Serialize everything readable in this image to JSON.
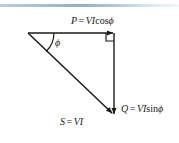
{
  "figure": {
    "type": "power-triangle-diagram",
    "background_color": "#ffffff",
    "stroke_color": "#1a1a1a",
    "top_rule_color": "#8fb0c7"
  },
  "labels": {
    "real_power": {
      "symbol": "P",
      "equals": "=",
      "magnitude": "VI",
      "trig": "cos",
      "angle": "ϕ",
      "full_text": "P = VI cos ϕ"
    },
    "reactive_power": {
      "symbol": "Q",
      "equals": "=",
      "magnitude": "VI",
      "trig": "sin",
      "angle": "ϕ",
      "full_text": "Q = VI sin ϕ"
    },
    "apparent_power": {
      "symbol": "S",
      "equals": "=",
      "magnitude": "VI",
      "full_text": "S = VI"
    },
    "phase_angle": {
      "symbol": "ϕ",
      "full_text": "ϕ"
    }
  },
  "geometry": {
    "apex": {
      "x": 28,
      "y": 33
    },
    "corner_right_angle": {
      "x": 114,
      "y": 33
    },
    "vertex_bottom": {
      "x": 114,
      "y": 115
    },
    "angle_arc_radius": 26,
    "right_angle_marker_size": 8
  }
}
